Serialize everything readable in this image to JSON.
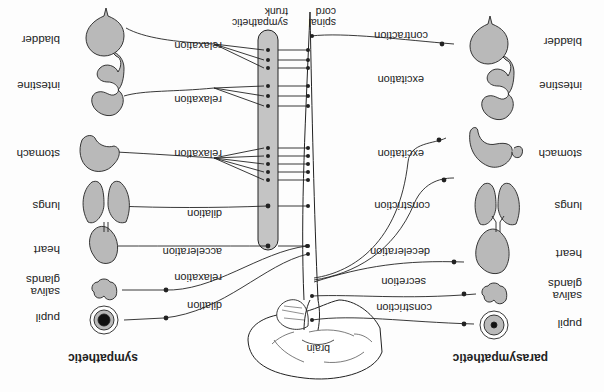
{
  "diagram": {
    "orientation": "rotated 180 degrees",
    "center": {
      "brain_label": "brain",
      "spinal_cord_label": "spinal cord",
      "sympathetic_trunk_label": "sympathetic trunk"
    },
    "parasympathetic": {
      "title": "parasympathetic",
      "organs": [
        {
          "organ": "pupil",
          "effect": "constriction"
        },
        {
          "organ": "saliva glands",
          "effect": "secretion"
        },
        {
          "organ": "heart",
          "effect": "deceleration"
        },
        {
          "organ": "lungs",
          "effect": "constriction"
        },
        {
          "organ": "stomach",
          "effect": "excitation"
        },
        {
          "organ": "intestine",
          "effect": "excitation"
        },
        {
          "organ": "bladder",
          "effect": "contraction"
        }
      ]
    },
    "sympathetic": {
      "title": "sympathetic",
      "organs": [
        {
          "organ": "pupil",
          "effect": "dilation"
        },
        {
          "organ": "saliva glands",
          "effect": "relaxation"
        },
        {
          "organ": "heart",
          "effect": "acceleration"
        },
        {
          "organ": "lungs",
          "effect": "dilation"
        },
        {
          "organ": "stomach",
          "effect": "relaxation"
        },
        {
          "organ": "intestine",
          "effect": "relaxation"
        },
        {
          "organ": "bladder",
          "effect": "relaxation"
        }
      ]
    },
    "colors": {
      "organ_fill": "#b9b9b9",
      "trunk_fill": "#c4c4c4",
      "line": "#222222",
      "background": "#fdfdfd"
    }
  }
}
